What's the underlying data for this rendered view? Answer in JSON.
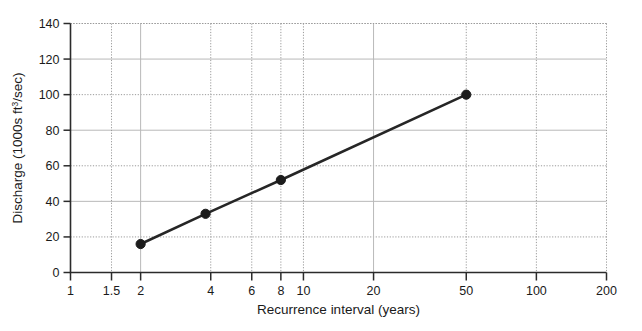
{
  "chart_data": {
    "type": "line",
    "title": "",
    "xlabel": "Recurrence interval (years)",
    "ylabel_full": "Discharge (1000s ft3/sec)",
    "ylabel_prefix": "Discharge (1000s ft",
    "ylabel_superscript": "3",
    "ylabel_suffix": "/sec)",
    "xscale": "log",
    "yscale": "linear",
    "xlim": [
      1,
      200
    ],
    "ylim": [
      0,
      140
    ],
    "xticks": [
      1,
      1.5,
      2,
      4,
      6,
      8,
      10,
      20,
      50,
      100,
      200
    ],
    "xtick_labels": [
      "1",
      "1.5",
      "2",
      "4",
      "6",
      "8",
      "10",
      "20",
      "50",
      "100",
      "200"
    ],
    "yticks": [
      0,
      20,
      40,
      60,
      80,
      100,
      120,
      140
    ],
    "ytick_labels": [
      "0",
      "20",
      "40",
      "60",
      "80",
      "100",
      "120",
      "140"
    ],
    "grid": true,
    "legend": false,
    "series": [
      {
        "name": "Discharge",
        "marker": "circle",
        "color": "#262626",
        "x": [
          2,
          3.8,
          8,
          50
        ],
        "values": [
          16,
          33,
          52,
          100
        ]
      }
    ]
  }
}
